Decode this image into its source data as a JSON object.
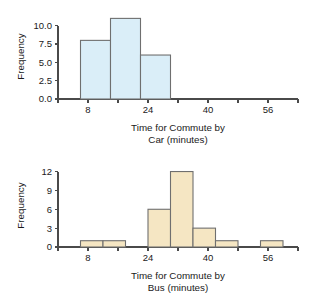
{
  "chart_data": [
    {
      "type": "bar",
      "id": "commute-car",
      "title": "",
      "xlabel_line1": "Time for Commute by",
      "xlabel_line2": "Car (minutes)",
      "ylabel": "Frequency",
      "xlim": [
        0,
        64
      ],
      "ylim": [
        0,
        11.6
      ],
      "grid": false,
      "legend": null,
      "x_major_ticks": [
        8,
        24,
        40,
        56
      ],
      "x_major_tick_labels": [
        "8",
        "24",
        "40",
        "56"
      ],
      "x_minor_ticks": [
        0,
        16,
        32,
        48,
        64
      ],
      "y_ticks": [
        0.0,
        2.5,
        5.0,
        7.5,
        10.0
      ],
      "y_tick_labels": [
        "0.0",
        "2.5",
        "5.0",
        "7.5",
        "10.0"
      ],
      "bin_edges": [
        6,
        14,
        22,
        30
      ],
      "categories": [
        "6-14",
        "14-22",
        "22-30"
      ],
      "values": [
        8,
        11,
        6
      ],
      "bar_fill": "#daeef8",
      "bar_stroke": "#6f6f6f"
    },
    {
      "type": "bar",
      "id": "commute-bus",
      "title": "",
      "xlabel_line1": "Time for Commute by",
      "xlabel_line2": "Bus (minutes)",
      "ylabel": "Frequency",
      "xlim": [
        0,
        64
      ],
      "ylim": [
        0,
        13.2
      ],
      "grid": false,
      "legend": null,
      "x_major_ticks": [
        8,
        24,
        40,
        56
      ],
      "x_major_tick_labels": [
        "8",
        "24",
        "40",
        "56"
      ],
      "x_minor_ticks": [
        0,
        16,
        32,
        48,
        64
      ],
      "y_ticks": [
        0,
        3,
        6,
        9,
        12
      ],
      "y_tick_labels": [
        "0",
        "3",
        "6",
        "9",
        "12"
      ],
      "bin_edges": [
        6,
        12,
        18,
        24,
        30,
        36,
        42,
        48,
        54,
        60
      ],
      "categories": [
        "6-12",
        "12-18",
        "18-24",
        "24-30",
        "30-36",
        "36-42",
        "42-48",
        "48-54",
        "54-60"
      ],
      "values": [
        1,
        1,
        0,
        6,
        12,
        3,
        1,
        0,
        1
      ],
      "bar_fill": "#f5e6c3",
      "bar_stroke": "#6f6f6f"
    }
  ]
}
